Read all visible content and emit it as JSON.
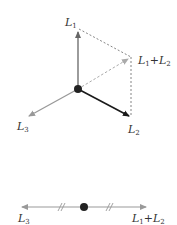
{
  "diagram": {
    "colors": {
      "l1": "#666666",
      "l2": "#1a1a1a",
      "l3": "#999999",
      "sum": "#aaaaaa",
      "dashed": "#666666",
      "dot": "#222222"
    },
    "top": {
      "labels": {
        "l1": {
          "base": "L",
          "sub": "1"
        },
        "l2": {
          "base": "L",
          "sub": "2"
        },
        "l3": {
          "base": "L",
          "sub": "3"
        },
        "sum": {
          "base1": "L",
          "sub1": "1",
          "plus": "+",
          "base2": "L",
          "sub2": "2"
        }
      }
    },
    "bottom": {
      "labels": {
        "left": {
          "base": "L",
          "sub": "3"
        },
        "right": {
          "base1": "L",
          "sub1": "1",
          "plus": "+",
          "base2": "L",
          "sub2": "2"
        }
      },
      "equal_length_marks": "//"
    }
  }
}
